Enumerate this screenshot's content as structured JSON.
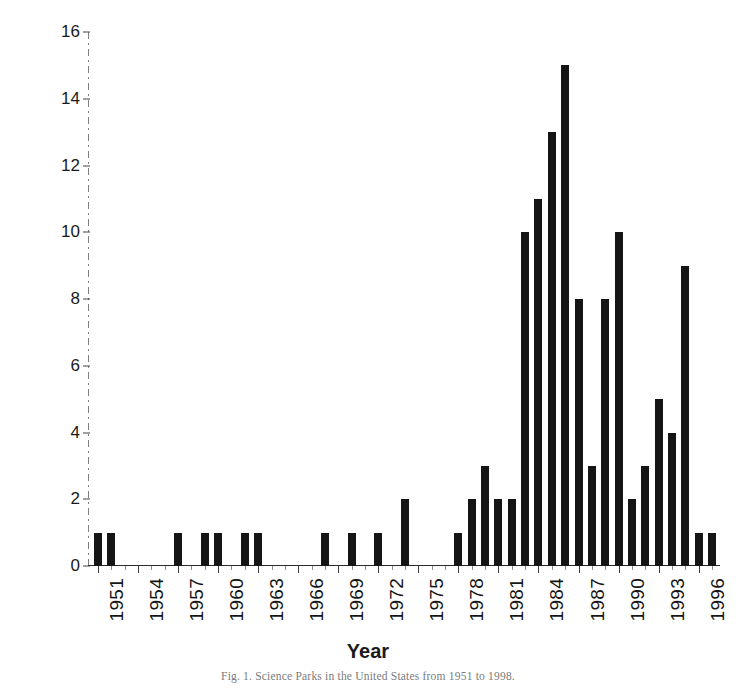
{
  "figure": {
    "caption": "Fig. 1. Science Parks in the United States from 1951 to 1998."
  },
  "chart_data": {
    "type": "bar",
    "title": "",
    "xlabel": "Year",
    "ylabel": "Number of Science Parks",
    "ylim": [
      0,
      16
    ],
    "ytick_labels": [
      "0",
      "2",
      "4",
      "6",
      "8",
      "10",
      "12",
      "14",
      "16"
    ],
    "ytick_values": [
      0,
      2,
      4,
      6,
      8,
      10,
      12,
      14,
      16
    ],
    "xtick_labels": [
      "1951",
      "1954",
      "1957",
      "1960",
      "1963",
      "1966",
      "1969",
      "1972",
      "1975",
      "1978",
      "1981",
      "1984",
      "1987",
      "1990",
      "1993",
      "1996"
    ],
    "xtick_values": [
      1951,
      1954,
      1957,
      1960,
      1963,
      1966,
      1969,
      1972,
      1975,
      1978,
      1981,
      1984,
      1987,
      1990,
      1993,
      1996
    ],
    "xlim": [
      1950.4,
      1997.6
    ],
    "grid": false,
    "legend": null,
    "bar_color": "#151515",
    "categories": [
      1951,
      1952,
      1953,
      1954,
      1955,
      1956,
      1957,
      1958,
      1959,
      1960,
      1961,
      1962,
      1963,
      1964,
      1965,
      1966,
      1967,
      1968,
      1969,
      1970,
      1971,
      1972,
      1973,
      1974,
      1975,
      1976,
      1977,
      1978,
      1979,
      1980,
      1981,
      1982,
      1983,
      1984,
      1985,
      1986,
      1987,
      1988,
      1989,
      1990,
      1991,
      1992,
      1993,
      1994,
      1995,
      1996,
      1997
    ],
    "values": [
      1,
      1,
      0,
      0,
      0,
      0,
      1,
      0,
      1,
      1,
      0,
      1,
      1,
      0,
      0,
      0,
      0,
      1,
      0,
      1,
      0,
      1,
      0,
      2,
      0,
      0,
      0,
      1,
      2,
      3,
      2,
      2,
      10,
      11,
      13,
      15,
      8,
      3,
      8,
      10,
      2,
      3,
      5,
      4,
      9,
      1,
      1
    ]
  }
}
